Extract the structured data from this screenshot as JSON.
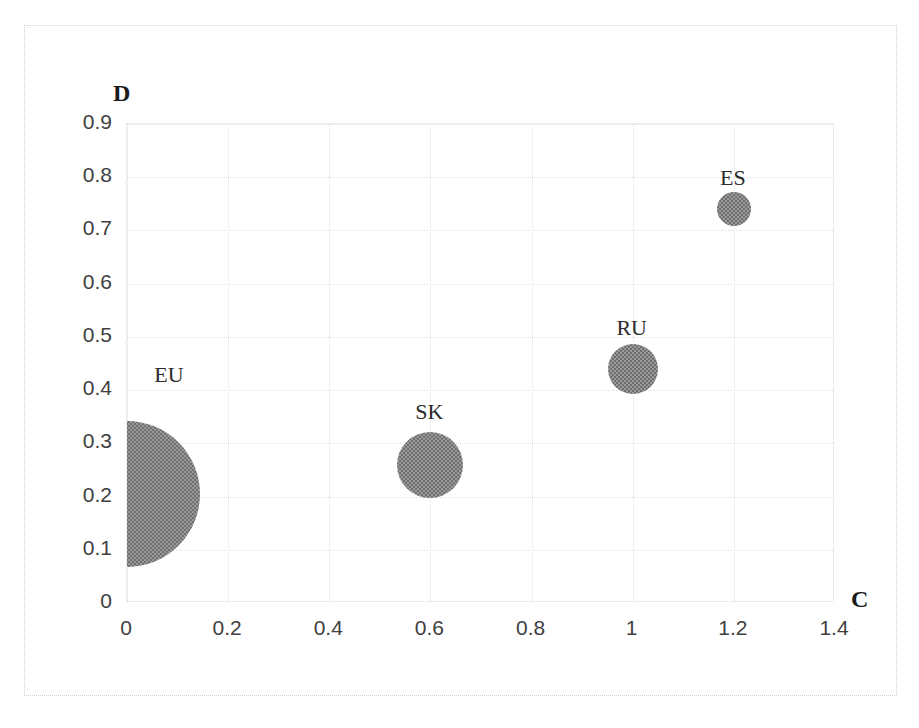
{
  "chart_data": {
    "type": "scatter",
    "title": "",
    "xlabel": "C",
    "ylabel": "D",
    "xlim": [
      0,
      1.4
    ],
    "ylim": [
      0,
      0.9
    ],
    "grid": true,
    "legend": "none",
    "xticks": [
      "0",
      "0.2",
      "0.4",
      "0.6",
      "0.8",
      "1",
      "1.2",
      "1.4"
    ],
    "xtick_values": [
      0,
      0.2,
      0.4,
      0.6,
      0.8,
      1.0,
      1.2,
      1.4
    ],
    "yticks": [
      "0",
      "0.1",
      "0.2",
      "0.3",
      "0.4",
      "0.5",
      "0.6",
      "0.7",
      "0.8",
      "0.9"
    ],
    "ytick_values": [
      0,
      0.1,
      0.2,
      0.3,
      0.4,
      0.5,
      0.6,
      0.7,
      0.8,
      0.9
    ],
    "points": [
      {
        "label": "EU",
        "x": 0.0,
        "y": 0.205,
        "radius_px": 73,
        "size": 73
      },
      {
        "label": "SK",
        "x": 0.6,
        "y": 0.26,
        "radius_px": 33,
        "size": 33
      },
      {
        "label": "RU",
        "x": 1.0,
        "y": 0.44,
        "radius_px": 25,
        "size": 25
      },
      {
        "label": "ES",
        "x": 1.2,
        "y": 0.74,
        "radius_px": 17,
        "size": 17
      }
    ],
    "bubble_color": "#808080",
    "grid_color": "#e2e2e2",
    "frame_color": "#cfcfcf"
  }
}
